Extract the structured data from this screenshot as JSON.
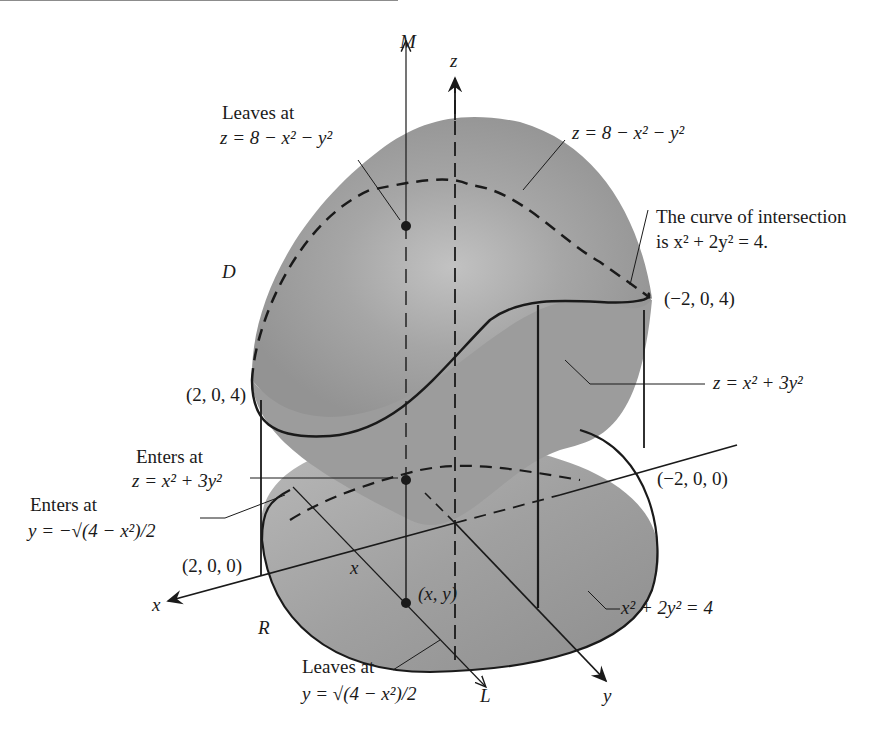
{
  "figure": {
    "axes": {
      "x": "x",
      "y": "y",
      "z": "z"
    },
    "lines": {
      "M": "M",
      "L": "L"
    },
    "regions": {
      "D": "D",
      "R": "R"
    },
    "point_xy": "(x, y)",
    "x_marker": "x"
  },
  "annotations": {
    "leaves_top": {
      "line1": "Leaves at",
      "line2": "z = 8 − x² − y²"
    },
    "upper_surface": "z = 8 − x² − y²",
    "curve": {
      "line1": "The curve of intersection",
      "line2": "is x² + 2y² = 4."
    },
    "point_m204": "(−2, 0, 4)",
    "point_204": "(2, 0, 4)",
    "lower_surface": "z = x² + 3y²",
    "enters_z": {
      "line1": "Enters at",
      "line2": "z = x² + 3y²"
    },
    "enters_y": {
      "line1": "Enters at",
      "line2": "y = −√(4 − x²)/2"
    },
    "point_m200": "(−2, 0, 0)",
    "point_200": "(2, 0, 0)",
    "ellipse": "x² + 2y² = 4",
    "leaves_y": {
      "line1": "Leaves at",
      "line2": "y = √(4 − x²)/2"
    }
  },
  "colors": {
    "surface": "#9a9a9a",
    "surface_light": "#adadad",
    "center": "#bdbdbd",
    "base": "#a4a4a4",
    "ink": "#1a1a1a"
  }
}
